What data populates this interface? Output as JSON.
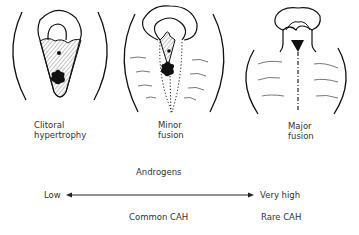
{
  "panels": [
    {
      "label_line1": "Clitoral",
      "label_line2": "hypertrophy"
    },
    {
      "label_line1": "Minor",
      "label_line2": "fusion"
    },
    {
      "label_line1": "Major",
      "label_line2": "fusion"
    }
  ],
  "scale": {
    "title": "Androgens",
    "low_label": "Low",
    "high_label": "Very high",
    "low_category": "Common CAH",
    "high_category": "Rare CAH"
  }
}
